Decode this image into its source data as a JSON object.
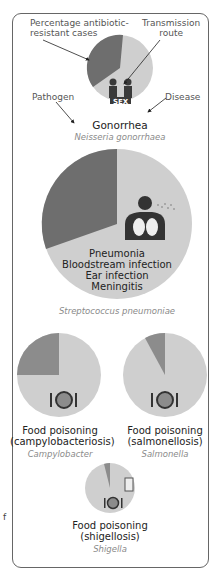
{
  "annotations": {
    "resistant": "Percentage antibiotic-resistant cases",
    "resistant_line1": "Percentage antibiotic-",
    "resistant_line2": "resistant cases",
    "route_line1": "Transmission",
    "route_line2": "route",
    "pathogen": "Pathogen",
    "disease": "Disease"
  },
  "items": [
    {
      "disease": "Gonorrhea",
      "pathogen": "Neisseria gonorrhaea",
      "route": "SEX",
      "resistant_pct": 37
    },
    {
      "disease_lines": [
        "Pneumonia",
        "Bloodstream infection",
        "Ear infection",
        "Meningitis"
      ],
      "pathogen": "Streptococcus pneumoniae",
      "route": "airborne",
      "resistant_pct": 30
    },
    {
      "disease_line1": "Food poisoning",
      "disease_line2": "(campylobacteriosis)",
      "pathogen": "Campylobacter",
      "route": "food",
      "resistant_pct": 25
    },
    {
      "disease_line1": "Food poisoning",
      "disease_line2": "(salmonellosis)",
      "pathogen": "Salmonella",
      "route": "food",
      "resistant_pct": 8
    },
    {
      "disease_line1": "Food poisoning",
      "disease_line2": "(shigellosis)",
      "pathogen": "Shigella",
      "route": "food and water",
      "resistant_pct": 5
    }
  ],
  "colors": {
    "resistant": "#6e6e6e",
    "susceptible": "#cfcfcf",
    "icon": "#3a3a3a",
    "plate": "#8c8c8c"
  },
  "cut_text": "f"
}
